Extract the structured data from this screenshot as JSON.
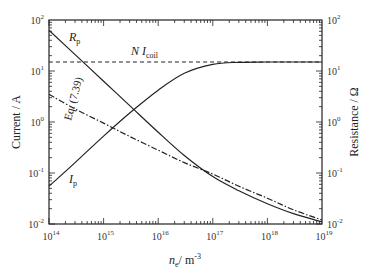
{
  "chart_data": {
    "type": "line",
    "title": "",
    "xlabel": "n_e / m^-3",
    "ylabel": "Current / A",
    "ylabel_right": "Resistance / Ω",
    "xscale": "log",
    "yscale": "log",
    "xlim": [
      100000000000000.0,
      1e+19
    ],
    "ylim": [
      0.01,
      100
    ],
    "ylim_right": [
      0.01,
      100
    ],
    "grid": false,
    "legend": "none (inline annotations)",
    "x_tick_labels": [
      "10^14",
      "10^15",
      "10^16",
      "10^17",
      "10^18",
      "10^19"
    ],
    "y_tick_labels": [
      "10^-2",
      "10^-1",
      "10^0",
      "10^1",
      "10^2"
    ],
    "y_tick_labels_right": [
      "10^-2",
      "10^-1",
      "10^0",
      "10^1",
      "10^2"
    ],
    "x": [
      100000000000000.0,
      300000000000000.0,
      1000000000000000.0,
      3000000000000000.0,
      1e+16,
      3e+16,
      1e+17,
      3e+17,
      1e+18,
      3e+18,
      1e+19
    ],
    "series": [
      {
        "name": "R_p",
        "axis": "right",
        "style": "solid",
        "values": [
          63,
          21,
          6.3,
          2.1,
          0.63,
          0.22,
          0.085,
          0.045,
          0.025,
          0.016,
          0.011
        ]
      },
      {
        "name": "I_p",
        "axis": "left",
        "style": "solid",
        "values": [
          0.055,
          0.16,
          0.53,
          1.5,
          4.2,
          9.0,
          13.5,
          14.8,
          15,
          15,
          15
        ]
      },
      {
        "name": "N I_coil",
        "axis": "left",
        "style": "dashed",
        "values": [
          15,
          15,
          15,
          15,
          15,
          15,
          15,
          15,
          15,
          15,
          15
        ]
      },
      {
        "name": "Eq. (7.39)",
        "axis": "right",
        "style": "dash-dot",
        "values": [
          3.5,
          1.8,
          0.95,
          0.52,
          0.28,
          0.16,
          0.095,
          0.055,
          0.032,
          0.019,
          0.012
        ]
      }
    ],
    "annotations": [
      {
        "text": "R_p",
        "near": [
          200000000000000.0,
          55
        ]
      },
      {
        "text": "N I_coil",
        "near": [
          3000000000000000.0,
          22
        ]
      },
      {
        "text": "Eq. (7.39)",
        "near": [
          200000000000000.0,
          2.2
        ]
      },
      {
        "text": "I_p",
        "near": [
          200000000000000.0,
          0.07
        ]
      }
    ]
  },
  "labels": {
    "ylabel_left": "Current / A",
    "ylabel_right": "Resistance / Ω",
    "xlabel_main": "n",
    "xlabel_sub": "e",
    "xlabel_unit": "/ m",
    "xlabel_exp": "-3",
    "annot_rp_main": "R",
    "annot_rp_sub": "p",
    "annot_ip_main": "I",
    "annot_ip_sub": "p",
    "annot_ni_main": "N I",
    "annot_ni_sub": "coil",
    "annot_eq": "Eq. (7.39)",
    "x_ticks": [
      {
        "base": "10",
        "exp": "14"
      },
      {
        "base": "10",
        "exp": "15"
      },
      {
        "base": "10",
        "exp": "16"
      },
      {
        "base": "10",
        "exp": "17"
      },
      {
        "base": "10",
        "exp": "18"
      },
      {
        "base": "10",
        "exp": "19"
      }
    ],
    "y_ticks": [
      {
        "base": "10",
        "exp": "-2"
      },
      {
        "base": "10",
        "exp": "-1"
      },
      {
        "base": "10",
        "exp": "0"
      },
      {
        "base": "10",
        "exp": "1"
      },
      {
        "base": "10",
        "exp": "2"
      }
    ]
  }
}
